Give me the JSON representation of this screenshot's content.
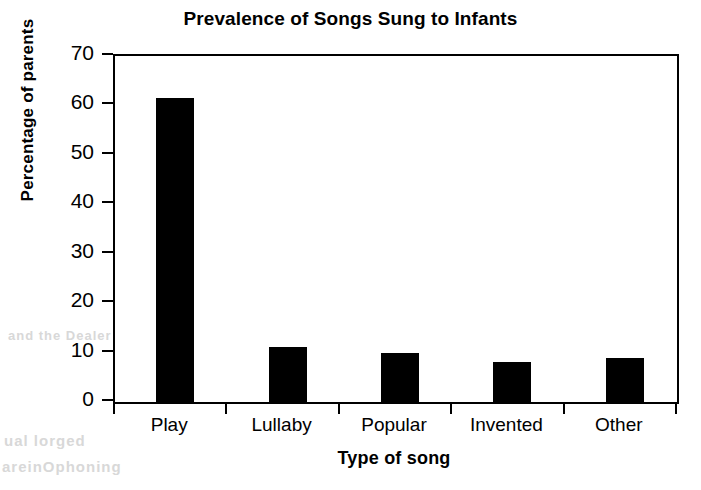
{
  "chart_data": {
    "type": "bar",
    "title": "Prevalence of Songs Sung to Infants",
    "xlabel": "Type of song",
    "ylabel": "Percentage of parents",
    "categories": [
      "Play",
      "Lullaby",
      "Popular",
      "Invented",
      "Other"
    ],
    "values": [
      61.5,
      11.2,
      10.0,
      8.0,
      9.0
    ],
    "series": [
      {
        "name": "Percentage of parents",
        "values": [
          61.5,
          11.2,
          10.0,
          8.0,
          9.0
        ]
      }
    ],
    "ylim": [
      0,
      70
    ],
    "ytick_labels": [
      "0",
      "10",
      "20",
      "30",
      "40",
      "50",
      "60",
      "70"
    ],
    "ytick_values": [
      0,
      10,
      20,
      30,
      40,
      50,
      60,
      70
    ],
    "grid": false,
    "legend": "none",
    "bar_color": "#000000",
    "background_color": "#ffffff",
    "axis_color": "#000000"
  },
  "artifacts": {
    "bleed_1": "bleed",
    "bleed_2": "scan artifact",
    "bleed_3": "show-through text",
    "bleed_4": "faint",
    "bleed_5": "faint",
    "bleed_6": "faint"
  }
}
